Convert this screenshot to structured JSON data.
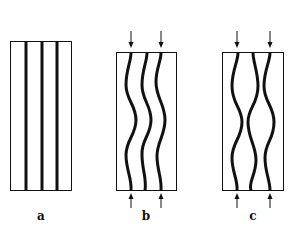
{
  "figure": {
    "panels": [
      {
        "id": "a",
        "label": "a",
        "description": "Three straight parallel fibers in a matrix, unloaded"
      },
      {
        "id": "b",
        "label": "b",
        "description": "Compressive load applied (arrows top and bottom); fibers buckle in-phase (shear mode)"
      },
      {
        "id": "c",
        "label": "c",
        "description": "Compressive load applied (arrows top and bottom); fibers buckle out-of-phase (extension mode)"
      }
    ],
    "colors": {
      "stroke": "#111111",
      "background": "#ffffff"
    }
  }
}
